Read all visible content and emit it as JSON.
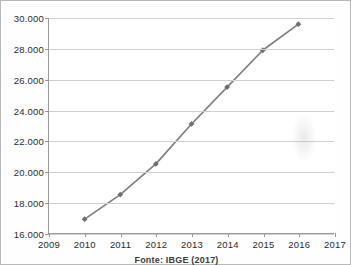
{
  "caption": {
    "source_note": "Fonte: IBGE (2017)"
  },
  "colors": {
    "line": "#808080",
    "marker": "#6f6f6f",
    "gridline": "#d0d0d0",
    "axis": "#9a9a9a",
    "text": "#2b2b2b",
    "background": "#ffffff"
  },
  "chart_data": {
    "type": "line",
    "title": "",
    "subtitle": "",
    "xlabel": "",
    "ylabel": "",
    "x": [
      2010,
      2011,
      2012,
      2013,
      2014,
      2015,
      2016
    ],
    "values": [
      16900,
      18500,
      20500,
      23100,
      25500,
      27900,
      29600
    ],
    "point_labels": [
      "16.900",
      "18.500",
      "20.500",
      "23.100",
      "25.500",
      "27.900",
      "29.600"
    ],
    "series": [
      {
        "name": "",
        "values": [
          16900,
          18500,
          20500,
          23100,
          25500,
          27900,
          29600
        ]
      }
    ],
    "xlim": [
      2009,
      2017
    ],
    "ylim": [
      16000,
      30000
    ],
    "xticks": [
      2009,
      2010,
      2011,
      2012,
      2013,
      2014,
      2015,
      2016,
      2017
    ],
    "xtick_labels": [
      "2009",
      "2010",
      "2011",
      "2012",
      "2013",
      "2014",
      "2015",
      "2016",
      "2017"
    ],
    "yticks": [
      16000,
      18000,
      20000,
      22000,
      24000,
      26000,
      28000,
      30000
    ],
    "ytick_labels": [
      "16.000",
      "18.000",
      "20.000",
      "22.000",
      "24.000",
      "26.000",
      "28.000",
      "30.000"
    ],
    "grid": true,
    "grid_axis": "y",
    "legend": false,
    "legend_position": "none",
    "marker": "diamond",
    "annotations": []
  }
}
